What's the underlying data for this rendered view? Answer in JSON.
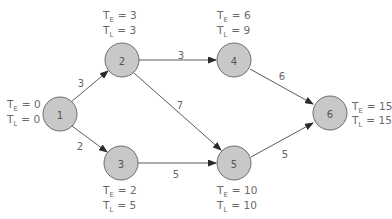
{
  "diagram": {
    "type": "activity-network (PERT/CPM)",
    "nodes": [
      {
        "id": "1",
        "label": "1",
        "te_label": "T",
        "te_sub": "E",
        "te_value": "= 0",
        "tl_label": "T",
        "tl_sub": "L",
        "tl_value": "= 0"
      },
      {
        "id": "2",
        "label": "2",
        "te_label": "T",
        "te_sub": "E",
        "te_value": "= 3",
        "tl_label": "T",
        "tl_sub": "L",
        "tl_value": "= 3"
      },
      {
        "id": "3",
        "label": "3",
        "te_label": "T",
        "te_sub": "E",
        "te_value": "= 2",
        "tl_label": "T",
        "tl_sub": "L",
        "tl_value": "= 5"
      },
      {
        "id": "4",
        "label": "4",
        "te_label": "T",
        "te_sub": "E",
        "te_value": "= 6",
        "tl_label": "T",
        "tl_sub": "L",
        "tl_value": "= 9"
      },
      {
        "id": "5",
        "label": "5",
        "te_label": "T",
        "te_sub": "E",
        "te_value": "= 10",
        "tl_label": "T",
        "tl_sub": "L",
        "tl_value": "= 10"
      },
      {
        "id": "6",
        "label": "6",
        "te_label": "T",
        "te_sub": "E",
        "te_value": "= 15",
        "tl_label": "T",
        "tl_sub": "L",
        "tl_value": "= 15"
      }
    ],
    "edges": [
      {
        "from": "1",
        "to": "2",
        "weight": "3"
      },
      {
        "from": "1",
        "to": "3",
        "weight": "2"
      },
      {
        "from": "2",
        "to": "4",
        "weight": "3"
      },
      {
        "from": "2",
        "to": "5",
        "weight": "7"
      },
      {
        "from": "3",
        "to": "5",
        "weight": "5"
      },
      {
        "from": "4",
        "to": "6",
        "weight": "6"
      },
      {
        "from": "5",
        "to": "6",
        "weight": "5"
      }
    ],
    "colors": {
      "node_fill": "#c8c8c8",
      "node_stroke": "#6b6b6b",
      "edge": "#5a5a5a",
      "text": "#666666"
    }
  }
}
